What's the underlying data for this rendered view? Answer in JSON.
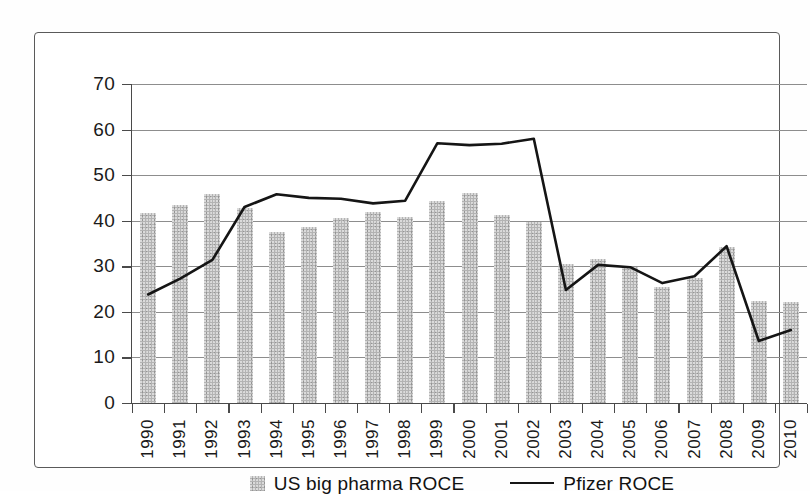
{
  "chart_data": {
    "type": "bar",
    "title": "",
    "subtitle": "",
    "xlabel": "",
    "ylabel": "",
    "ylim": [
      0,
      70
    ],
    "ytick_values": [
      0,
      10,
      20,
      30,
      40,
      50,
      60,
      70
    ],
    "ytick_labels": [
      "0",
      "10",
      "20",
      "30",
      "40",
      "50",
      "60",
      "70"
    ],
    "grid": true,
    "legend_position": "bottom-center",
    "categories": [
      "1990",
      "1991",
      "1992",
      "1993",
      "1994",
      "1995",
      "1996",
      "1997",
      "1998",
      "1999",
      "2000",
      "2001",
      "2002",
      "2003",
      "2004",
      "2005",
      "2006",
      "2007",
      "2008",
      "2009",
      "2010"
    ],
    "series": [
      {
        "name": "US big pharma ROCE",
        "type": "bar",
        "color": "#b3b3b3",
        "values": [
          41.8,
          43.4,
          45.8,
          42.8,
          37.6,
          38.7,
          40.7,
          41.9,
          40.8,
          44.4,
          46.1,
          41.3,
          39.8,
          30.6,
          31.7,
          29.9,
          25.4,
          27.4,
          34.2,
          22.5,
          22.2
        ]
      },
      {
        "name": "Pfizer ROCE",
        "type": "line",
        "color": "#151515",
        "values": [
          23.8,
          27.3,
          31.4,
          43.0,
          45.8,
          45.0,
          44.8,
          43.8,
          44.4,
          57.0,
          56.6,
          56.9,
          58.0,
          24.8,
          30.3,
          29.8,
          26.3,
          27.8,
          34.4,
          13.6,
          16.0
        ]
      }
    ],
    "legend": [
      {
        "label": "US big pharma ROCE",
        "marker": "bar-swatch"
      },
      {
        "label": "Pfizer ROCE",
        "marker": "line-swatch"
      }
    ]
  },
  "colors": {
    "bar_fill": "#b3b3b3",
    "line_stroke": "#151515",
    "gridline": "#8d8d8d",
    "axis": "#4a4a4a",
    "frame_border": "#5a5a5a",
    "background": "#ffffff",
    "text": "#111111"
  }
}
